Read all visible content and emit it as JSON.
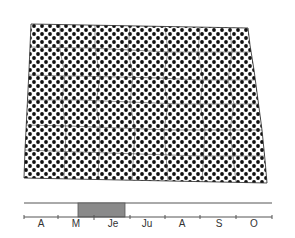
{
  "figure": {
    "type": "range-map-with-phenology-bar",
    "map": {
      "region": "North Dakota (county outlines)",
      "fill": "stippled dot pattern covering entire state",
      "dot_color": "#111111",
      "background_color": "#ffffff"
    },
    "timeline": {
      "months": [
        "A",
        "M",
        "Je",
        "Ju",
        "A",
        "S",
        "O"
      ],
      "highlight": {
        "start_label": "M",
        "end_label": "Je",
        "description": "period from early/mid May through mid June",
        "color": "#8a8a8a"
      },
      "line_color": "#555555"
    }
  }
}
